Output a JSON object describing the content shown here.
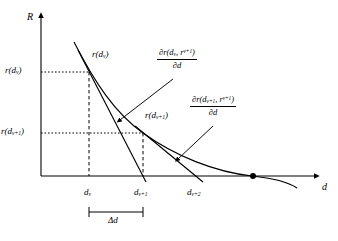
{
  "figure": {
    "type": "math-diagram"
  },
  "axes": {
    "y_label": "R",
    "x_label": "d",
    "origin_px": [
      41,
      176
    ],
    "x_axis_end_px": [
      318,
      176
    ],
    "y_axis_top_px": [
      41,
      14
    ]
  },
  "y_ticks": [
    {
      "label_html": "r(d<sub>v</sub>)",
      "y_px": 72
    },
    {
      "label_html": "r(d<sub>v+1</sub>)",
      "y_px": 133
    }
  ],
  "x_ticks": [
    {
      "label_html": "d<sub>v</sub>",
      "x_px": 89
    },
    {
      "label_html": "d<sub>v+1</sub>",
      "x_px": 143
    },
    {
      "label_html": "d<sub>v+2</sub>",
      "x_px": 196
    }
  ],
  "curve_labels": [
    {
      "name": "curve-point-label-dv",
      "html": "r(d<sub>v</sub>)",
      "x_px": 92,
      "y_px": 55
    },
    {
      "name": "curve-point-label-dv1",
      "html": "r(d<sub>v+1</sub>)",
      "x_px": 145,
      "y_px": 116
    }
  ],
  "annotations": [
    {
      "name": "partial-derivative-dv",
      "numerator_html": "&#8706;r(d<sub>v</sub>, r<sup>v+1</sup>)",
      "denominator_html": "&#8706;d",
      "x_px": 157,
      "y_px": 50
    },
    {
      "name": "partial-derivative-dv1",
      "numerator_html": "&#8706;r(d<sub>v+1</sub>, r<sup>v+1</sup>)",
      "denominator_html": "&#8706;d",
      "x_px": 190,
      "y_px": 97
    }
  ],
  "delta_bracket": {
    "label_html": "&#916;d",
    "from_x_px": 89,
    "to_x_px": 143,
    "y_px": 212,
    "label_x_px": 116,
    "label_y_px": 217
  },
  "root_marker": {
    "x_px": 253,
    "y_px": 176,
    "radius_px": 3
  },
  "colors": {
    "ink": "#000000",
    "background": "#ffffff",
    "guide": "#000000"
  }
}
